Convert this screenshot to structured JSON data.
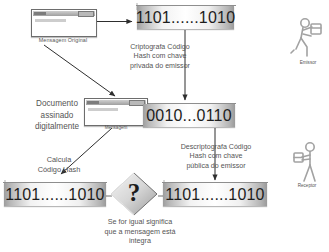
{
  "diagram": {
    "boxes": {
      "hash_top": "1101......1010",
      "encrypted_mid": "0010...0110",
      "hash_bottom_left": "1101......1010",
      "hash_bottom_right": "1101......1010"
    },
    "labels": {
      "mensagem_original": "Mensagem Original",
      "mensagem_assinada": "Mensagem",
      "documento_assinado": "Documento\nassinado\ndigitalmente",
      "criptografa": "Criptografa Código\nHash com chave\nprivada do emissor",
      "descriptografa": "Descriptografa Código\nHash com chave\npública do emissor",
      "calcula_hash": "Calcula\nCódigo Hash",
      "comparacao": "Se for igual significa\nque a mensagem está\nintegra",
      "emissor": "Emissor",
      "receptor": "Receptor",
      "question_mark": "?"
    },
    "colors": {
      "text": "#555555",
      "binary_text": "#1d1d1d",
      "stroke": "#3a3a3a",
      "box_shade_dark": "#9d9d9d",
      "box_shade_light": "#ffffff",
      "person": "#9a9a9a"
    }
  }
}
